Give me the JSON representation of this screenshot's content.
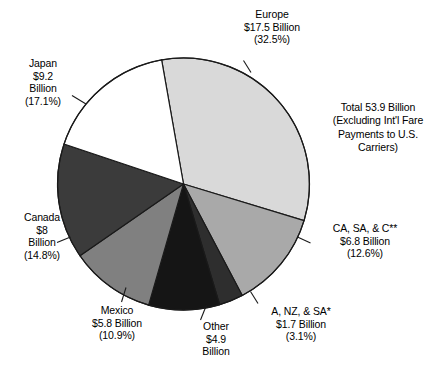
{
  "chart_data": {
    "type": "pie",
    "title": "",
    "total_note": "Total 53.9 Billion\n(Excluding Int'l Fare\nPayments to U.S.\nCarriers)",
    "total_value": 53.9,
    "units": "Billion",
    "legend_position": "callout-labels",
    "start_angle_deg": -10,
    "direction": "clockwise",
    "categories": [
      "Europe",
      "CA, SA, & C**",
      "A, NZ, & SA*",
      "Other",
      "Mexico",
      "Canada",
      "Japan"
    ],
    "values": [
      17.5,
      6.8,
      1.7,
      4.9,
      5.8,
      8.0,
      9.2
    ],
    "percents": [
      32.5,
      12.6,
      3.1,
      9.1,
      10.9,
      14.8,
      17.1
    ],
    "colors": [
      "#d9d9d9",
      "#a9a9a9",
      "#2e2e2e",
      "#151515",
      "#808080",
      "#3b3b3b",
      "#ffffff"
    ],
    "slices": [
      {
        "name": "Europe",
        "label_lines": [
          "Europe",
          "$17.5 Billion",
          "(32.5%)"
        ],
        "value": 17.5,
        "percent": 32.5,
        "color": "#d9d9d9"
      },
      {
        "name": "CA, SA, & C**",
        "label_lines": [
          "CA, SA, & C**",
          "$6.8 Billion",
          "(12.6%)"
        ],
        "value": 6.8,
        "percent": 12.6,
        "color": "#a9a9a9"
      },
      {
        "name": "A, NZ, & SA*",
        "label_lines": [
          "A, NZ, & SA*",
          "$1.7 Billion",
          "(3.1%)"
        ],
        "value": 1.7,
        "percent": 3.1,
        "color": "#2e2e2e"
      },
      {
        "name": "Other",
        "label_lines": [
          "Other",
          "$4.9",
          "Billion"
        ],
        "value": 4.9,
        "percent": 9.1,
        "color": "#151515"
      },
      {
        "name": "Mexico",
        "label_lines": [
          "Mexico",
          "$5.8 Billion",
          "(10.9%)"
        ],
        "value": 5.8,
        "percent": 10.9,
        "color": "#808080"
      },
      {
        "name": "Canada",
        "label_lines": [
          "Canada",
          "$8",
          "Billion",
          "(14.8%)"
        ],
        "value": 8.0,
        "percent": 14.8,
        "color": "#3b3b3b"
      },
      {
        "name": "Japan",
        "label_lines": [
          "Japan",
          "$9.2",
          "Billion",
          "(17.1%)"
        ],
        "value": 9.2,
        "percent": 17.1,
        "color": "#ffffff"
      }
    ]
  },
  "labels": {
    "europe": "Europe\n$17.5 Billion\n(32.5%)",
    "japan": "Japan\n$9.2\nBillion\n(17.1%)",
    "canada": "Canada\n$8\nBillion\n(14.8%)",
    "mexico": "Mexico\n$5.8 Billion\n(10.9%)",
    "other": "Other\n$4.9\nBillion",
    "anzsa": "A, NZ, & SA*\n$1.7 Billion\n(3.1%)",
    "casac": "CA, SA, & C**\n$6.8 Billion\n(12.6%)",
    "total": "Total 53.9 Billion\n(Excluding Int'l Fare\nPayments to U.S.\nCarriers)"
  },
  "geometry": {
    "center_x": 183.5,
    "center_y": 184,
    "radius": 126,
    "stroke": "#1a1a1a",
    "stroke_width": 1.2
  }
}
